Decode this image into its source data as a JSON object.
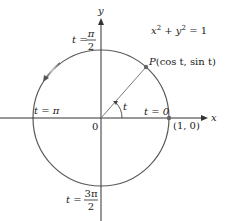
{
  "diagram": {
    "equation": "x² + y² = 1",
    "equation_parts": {
      "x": "x",
      "exp1": "2",
      "plus": " + ",
      "y": "y",
      "exp2": "2",
      "eq": " = 1"
    },
    "axes": {
      "x_label": "x",
      "y_label": "y",
      "origin_label": "0"
    },
    "point_P": {
      "label": "P",
      "coords": "(cos t, sin t)",
      "angle_deg": 48.6
    },
    "point_1_0": {
      "label": "(1, 0)"
    },
    "angle_label": "t",
    "parameter_labels": {
      "t0": "t = 0",
      "t_pi": "t = π",
      "t_pi2_lhs": "t = ",
      "t_pi2_num": "π",
      "t_pi2_den": "2",
      "t_3pi2_lhs": "t = ",
      "t_3pi2_num": "3π",
      "t_3pi2_den": "2"
    },
    "colors": {
      "circle": "#555555",
      "axes": "#333333",
      "radius_line": "#777777",
      "point": "#666666",
      "arrow_highlight": "#bbbbbb",
      "text": "#222222"
    }
  }
}
